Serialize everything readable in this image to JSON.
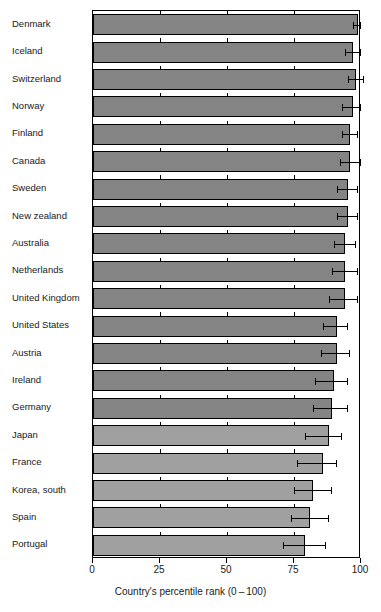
{
  "chart_data": {
    "type": "bar",
    "orientation": "horizontal",
    "title": "",
    "xlabel": "Country's percentile rank (0 – 100)",
    "ylabel": "",
    "xlim": [
      0,
      100
    ],
    "xticks": [
      0,
      25,
      50,
      75,
      100
    ],
    "xticklabels": [
      "0",
      "25",
      "50",
      "75",
      "100"
    ],
    "grid": false,
    "legend": null,
    "error_bar_type": "confidence interval",
    "categories": [
      "Denmark",
      "Iceland",
      "Switzerland",
      "Norway",
      "Finland",
      "Canada",
      "Sweden",
      "New zealand",
      "Australia",
      "Netherlands",
      "United Kingdom",
      "United States",
      "Austria",
      "Ireland",
      "Germany",
      "Japan",
      "France",
      "Korea, south",
      "Spain",
      "Portugal"
    ],
    "values": [
      99,
      97,
      98,
      97,
      96,
      96,
      95,
      95,
      94,
      94,
      94,
      91,
      91,
      90,
      89,
      88,
      86,
      82,
      81,
      79
    ],
    "err_low": [
      97,
      94,
      95,
      93,
      93,
      92,
      91,
      91,
      90,
      89,
      88,
      86,
      85,
      83,
      82,
      79,
      76,
      75,
      74,
      71
    ],
    "err_high": [
      100,
      100,
      101,
      100,
      99,
      100,
      99,
      99,
      98,
      99,
      99,
      95,
      96,
      95,
      95,
      93,
      91,
      89,
      88,
      87
    ],
    "series": [
      {
        "name": "Country's percentile rank",
        "values": [
          99,
          97,
          98,
          97,
          96,
          96,
          95,
          95,
          94,
          94,
          94,
          91,
          91,
          90,
          89,
          88,
          86,
          82,
          81,
          79
        ]
      }
    ],
    "bar_shades": [
      "dark",
      "dark",
      "dark",
      "dark",
      "dark",
      "dark",
      "dark",
      "dark",
      "dark",
      "dark",
      "dark",
      "dark",
      "dark",
      "dark",
      "dark",
      "light",
      "light",
      "light",
      "light",
      "light"
    ],
    "colors": {
      "bar_dark": "#848484",
      "bar_light": "#a0a0a0",
      "axis": "#000000",
      "background": "#ffffff"
    }
  }
}
